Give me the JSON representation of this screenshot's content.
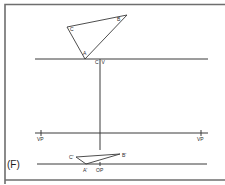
{
  "figure": {
    "panel_label": "(F)",
    "top_view": {
      "triangle_labels": {
        "a": "A",
        "b": "B",
        "c": "C"
      },
      "picture_plane_labels": {
        "c": "C",
        "v": "V"
      }
    },
    "horizon": {
      "vp_left_label": "VP",
      "vp_right_label": "VP"
    },
    "perspective_view": {
      "triangle_labels": {
        "a": "A'",
        "b": "B'",
        "c": "C'"
      },
      "op_label": "OP"
    }
  }
}
